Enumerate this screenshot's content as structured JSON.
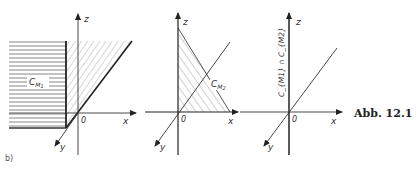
{
  "figure": {
    "caption": "Abb. 12.1",
    "part_label": "b)"
  },
  "panels": [
    {
      "id": "panel-1",
      "axes": {
        "x": "x",
        "y": "y",
        "z": "z",
        "origin": "0"
      },
      "region_label": "C",
      "region_sub": "M",
      "region_subsub": "1"
    },
    {
      "id": "panel-2",
      "axes": {
        "x": "x",
        "y": "y",
        "z": "z",
        "origin": "0"
      },
      "region_label": "C",
      "region_sub": "M",
      "region_subsub": "2"
    },
    {
      "id": "panel-3",
      "axes": {
        "x": "x",
        "y": "y",
        "z": "z",
        "origin": "0"
      },
      "intersection_label": "C_{M1} ∩ C_{M2}"
    }
  ],
  "colors": {
    "line": "#333333",
    "hatch": "#777777"
  }
}
